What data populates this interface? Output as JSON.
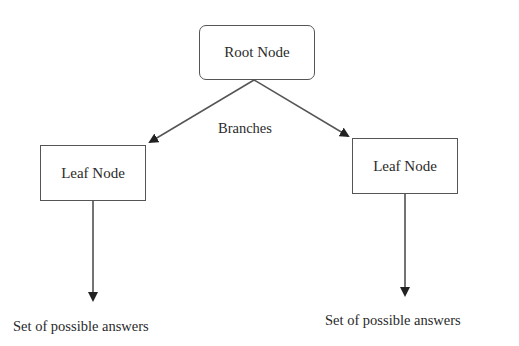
{
  "diagram": {
    "root": {
      "label": "Root Node"
    },
    "edge_label": "Branches",
    "leaves": [
      {
        "label": "Leaf Node",
        "answer": "Set of possible answers"
      },
      {
        "label": "Leaf Node",
        "answer": "Set of possible answers"
      }
    ],
    "colors": {
      "line": "#444444",
      "text": "#2a2a2a",
      "background": "#ffffff"
    }
  }
}
